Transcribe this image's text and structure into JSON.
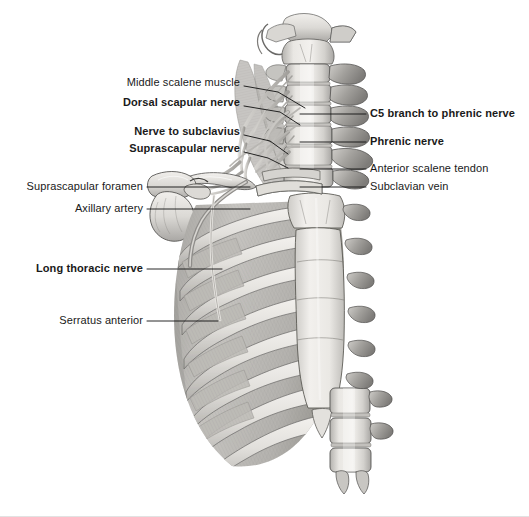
{
  "figure": {
    "background_color": "#ffffff",
    "text_color": "#1a1a1a",
    "leader_line_color": "#111111",
    "width": 529,
    "height": 517
  },
  "labels_left": [
    {
      "id": "middle-scalene-muscle",
      "text": "Middle scalene muscle",
      "bold": false,
      "text_right_x": 240,
      "text_y": 84,
      "leader": [
        [
          244,
          86
        ],
        [
          278,
          92
        ],
        [
          305,
          108
        ]
      ]
    },
    {
      "id": "dorsal-scapular-nerve",
      "text": "Dorsal scapular nerve",
      "bold": true,
      "text_right_x": 240,
      "text_y": 104,
      "leader": [
        [
          244,
          106
        ],
        [
          280,
          112
        ],
        [
          300,
          125
        ]
      ]
    },
    {
      "id": "nerve-to-subclavius",
      "text": "Nerve to subclavius",
      "bold": true,
      "text_right_x": 240,
      "text_y": 133,
      "leader": [
        [
          244,
          135
        ],
        [
          270,
          141
        ],
        [
          288,
          154
        ]
      ]
    },
    {
      "id": "suprascapular-nerve",
      "text": "Suprascapular nerve",
      "bold": true,
      "text_right_x": 240,
      "text_y": 150,
      "leader": [
        [
          244,
          152
        ],
        [
          268,
          158
        ],
        [
          288,
          168
        ]
      ]
    },
    {
      "id": "suprascapular-foramen",
      "text": "Suprascapular foramen",
      "bold": false,
      "text_right_x": 143,
      "text_y": 188,
      "leader": [
        [
          147,
          187
        ],
        [
          250,
          187
        ]
      ]
    },
    {
      "id": "axillary-artery",
      "text": "Axillary artery",
      "bold": false,
      "text_right_x": 143,
      "text_y": 210,
      "leader": [
        [
          147,
          209
        ],
        [
          250,
          209
        ]
      ]
    },
    {
      "id": "long-thoracic-nerve",
      "text": "Long thoracic nerve",
      "bold": true,
      "text_right_x": 143,
      "text_y": 270,
      "leader": [
        [
          147,
          269
        ],
        [
          222,
          269
        ]
      ]
    },
    {
      "id": "serratus-anterior",
      "text": "Serratus anterior",
      "bold": false,
      "text_right_x": 143,
      "text_y": 322,
      "leader": [
        [
          147,
          321
        ],
        [
          218,
          321
        ]
      ]
    }
  ],
  "labels_right": [
    {
      "id": "c5-branch-to-phrenic-nerve",
      "text": "C5 branch to phrenic nerve",
      "bold": true,
      "text_left_x": 370,
      "text_y": 115,
      "leader": [
        [
          366,
          114
        ],
        [
          300,
          114
        ]
      ]
    },
    {
      "id": "phrenic-nerve",
      "text": "Phrenic nerve",
      "bold": true,
      "text_left_x": 370,
      "text_y": 143,
      "leader": [
        [
          366,
          142
        ],
        [
          300,
          142
        ]
      ]
    },
    {
      "id": "anterior-scalene-tendon",
      "text": "Anterior scalene tendon",
      "bold": false,
      "text_left_x": 370,
      "text_y": 170,
      "leader": [
        [
          366,
          169
        ],
        [
          300,
          169
        ]
      ]
    },
    {
      "id": "subclavian-vein",
      "text": "Subclavian vein",
      "bold": false,
      "text_left_x": 370,
      "text_y": 188,
      "leader": [
        [
          366,
          187
        ],
        [
          300,
          187
        ]
      ]
    }
  ],
  "anatomy_parts": [
    "occiput-and-atlas",
    "cervical-vertebrae",
    "cervical-transverse-processes",
    "brachial-plexus-roots",
    "scalene-muscles",
    "clavicle",
    "scapula-acromion",
    "coracoid-process",
    "rib-cage",
    "costal-cartilages",
    "sternum-manubrium",
    "sternum-body",
    "xiphoid-process",
    "serratus-anterior-slips",
    "lumbar-vertebrae",
    "axillary-artery-vessel",
    "long-thoracic-nerve-branch"
  ],
  "palette": {
    "bone_light": "#eceae6",
    "bone_mid": "#d3d1cd",
    "bone_shadow": "#a9a7a4",
    "bone_outline": "#4e4d4c",
    "muscle_light": "#d8d6d2",
    "muscle_mid": "#b9b7b3",
    "muscle_dark": "#8f8d8a",
    "cartilage": "#e4e2de",
    "nerve": "#c9c7c3",
    "vessel": "#9a9896",
    "sternum": "#e9e7e3"
  }
}
